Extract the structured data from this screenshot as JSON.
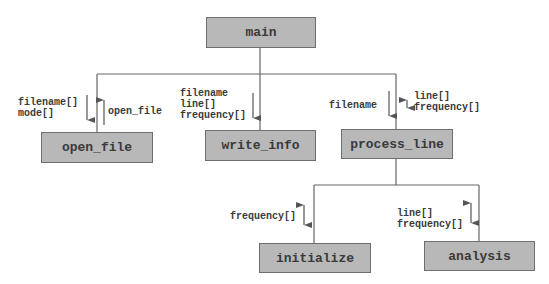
{
  "diagram": {
    "type": "structure-chart",
    "nodes": [
      {
        "id": "main",
        "label": "main"
      },
      {
        "id": "open_file",
        "label": "open_file"
      },
      {
        "id": "write_info",
        "label": "write_info"
      },
      {
        "id": "process_line",
        "label": "process_line"
      },
      {
        "id": "initialize",
        "label": "initialize"
      },
      {
        "id": "analysis",
        "label": "analysis"
      }
    ],
    "edges": [
      {
        "from": "main",
        "to": "open_file"
      },
      {
        "from": "main",
        "to": "write_info"
      },
      {
        "from": "main",
        "to": "process_line"
      },
      {
        "from": "process_line",
        "to": "initialize"
      },
      {
        "from": "process_line",
        "to": "analysis"
      }
    ],
    "flows": {
      "open_file_in": "filename[]\nmode[]",
      "open_file_out": "open_file",
      "write_info_in": "filename\nline[]\nfrequency[]",
      "process_line_in": "filename",
      "process_line_inout": "line[]\nfrequency[]",
      "initialize_inout": "frequency[]",
      "analysis_inout": "line[]\nfrequency[]"
    }
  },
  "colors": {
    "box_fill": "#b8b8b8",
    "box_border": "#6e6e6e",
    "line": "#555555",
    "text": "#3a3a3a"
  }
}
